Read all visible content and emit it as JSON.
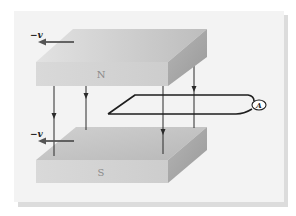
{
  "figure": {
    "top_magnet": {
      "pole_label": "N",
      "velocity_label": "−v"
    },
    "bottom_magnet": {
      "pole_label": "S",
      "velocity_label": "−v"
    },
    "ammeter_label": "A"
  },
  "colors": {
    "frame_bg": "#f2f2f2",
    "frame_shadow": "#d6d6d6",
    "magnet_top_face": "#c9c9c9",
    "magnet_front_face": "#d2d2d2",
    "magnet_side_face": "#a8a8a8",
    "pole_text": "#8a8a8a",
    "line": "#2a2a2a",
    "velocity_arrow": "#555555"
  }
}
